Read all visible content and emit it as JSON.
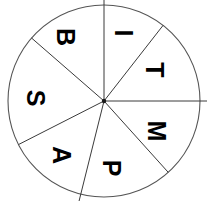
{
  "diagram": {
    "type": "segmented-wheel",
    "title": "",
    "shape": "circle",
    "center": {
      "x": 104,
      "y": 101
    },
    "radius": 96,
    "background_color": "#ffffff",
    "line_color": "#3a3a3a",
    "rim_color": "#555555",
    "text_color": "#000000",
    "label_rotation_degrees": 90,
    "segment_count": 7,
    "segments": [
      {
        "label": "B",
        "name": "segment-b",
        "start_angle": -139,
        "end_angle": -90,
        "label_x": 66,
        "label_y": 37
      },
      {
        "label": "I",
        "name": "segment-i",
        "start_angle": -90,
        "end_angle": -52,
        "label_x": 124,
        "label_y": 33
      },
      {
        "label": "T",
        "name": "segment-t",
        "start_angle": -52,
        "end_angle": 0,
        "label_x": 155,
        "label_y": 70
      },
      {
        "label": "M",
        "name": "segment-m",
        "start_angle": 0,
        "end_angle": 48,
        "label_x": 157,
        "label_y": 131
      },
      {
        "label": "P",
        "name": "segment-p",
        "start_angle": 48,
        "end_angle": 104,
        "label_x": 112,
        "label_y": 168
      },
      {
        "label": "A",
        "name": "segment-a",
        "start_angle": 104,
        "end_angle": 153,
        "label_x": 62,
        "label_y": 155
      },
      {
        "label": "S",
        "name": "segment-s",
        "start_angle": 153,
        "end_angle": 221,
        "label_x": 36,
        "label_y": 98
      }
    ],
    "spokes": [
      {
        "name": "spoke-top",
        "angle": -90,
        "length": 110,
        "overshoot": true
      },
      {
        "name": "spoke-upper-right",
        "angle": -52,
        "length": 96,
        "overshoot": false
      },
      {
        "name": "spoke-right",
        "angle": 0,
        "length": 105,
        "overshoot": true
      },
      {
        "name": "spoke-lower-right",
        "angle": 48,
        "length": 96,
        "overshoot": false
      },
      {
        "name": "spoke-bottom",
        "angle": 104,
        "length": 112,
        "overshoot": true
      },
      {
        "name": "spoke-lower-left",
        "angle": 153,
        "length": 96,
        "overshoot": false
      },
      {
        "name": "spoke-upper-left",
        "angle": 221,
        "length": 96,
        "overshoot": false
      }
    ]
  }
}
